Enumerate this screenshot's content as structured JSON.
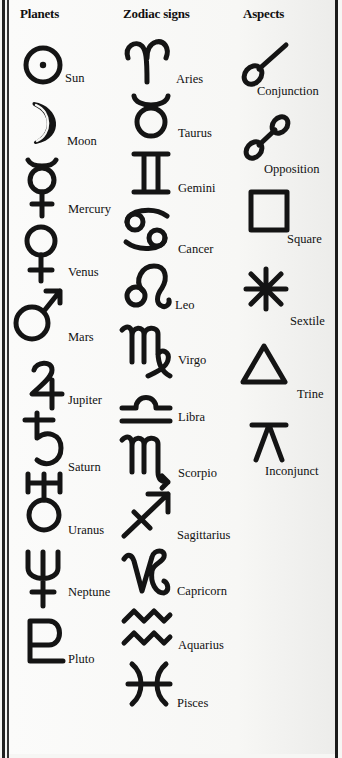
{
  "headers": {
    "planets": "Planets",
    "zodiac": "Zodiac signs",
    "aspects": "Aspects"
  },
  "planets": [
    {
      "name": "Sun",
      "icon": "sun-icon",
      "glyph": "☉"
    },
    {
      "name": "Moon",
      "icon": "moon-icon",
      "glyph": "☽"
    },
    {
      "name": "Mercury",
      "icon": "mercury-icon",
      "glyph": "☿"
    },
    {
      "name": "Venus",
      "icon": "venus-icon",
      "glyph": "♀"
    },
    {
      "name": "Mars",
      "icon": "mars-icon",
      "glyph": "♂"
    },
    {
      "name": "Jupiter",
      "icon": "jupiter-icon",
      "glyph": "♃"
    },
    {
      "name": "Saturn",
      "icon": "saturn-icon",
      "glyph": "♄"
    },
    {
      "name": "Uranus",
      "icon": "uranus-icon",
      "glyph": "♅"
    },
    {
      "name": "Neptune",
      "icon": "neptune-icon",
      "glyph": "♆"
    },
    {
      "name": "Pluto",
      "icon": "pluto-icon",
      "glyph": "♇"
    }
  ],
  "zodiac": [
    {
      "name": "Aries",
      "icon": "aries-icon",
      "glyph": "♈"
    },
    {
      "name": "Taurus",
      "icon": "taurus-icon",
      "glyph": "♉"
    },
    {
      "name": "Gemini",
      "icon": "gemini-icon",
      "glyph": "♊"
    },
    {
      "name": "Cancer",
      "icon": "cancer-icon",
      "glyph": "♋"
    },
    {
      "name": "Leo",
      "icon": "leo-icon",
      "glyph": "♌"
    },
    {
      "name": "Virgo",
      "icon": "virgo-icon",
      "glyph": "♍"
    },
    {
      "name": "Libra",
      "icon": "libra-icon",
      "glyph": "♎"
    },
    {
      "name": "Scorpio",
      "icon": "scorpio-icon",
      "glyph": "♏"
    },
    {
      "name": "Sagittarius",
      "icon": "sagittarius-icon",
      "glyph": "♐"
    },
    {
      "name": "Capricorn",
      "icon": "capricorn-icon",
      "glyph": "♑"
    },
    {
      "name": "Aquarius",
      "icon": "aquarius-icon",
      "glyph": "♒"
    },
    {
      "name": "Pisces",
      "icon": "pisces-icon",
      "glyph": "♓"
    }
  ],
  "aspects": [
    {
      "name": "Conjunction",
      "icon": "conjunction-icon",
      "glyph": "☌"
    },
    {
      "name": "Opposition",
      "icon": "opposition-icon",
      "glyph": "☍"
    },
    {
      "name": "Square",
      "icon": "square-icon",
      "glyph": "□"
    },
    {
      "name": "Sextile",
      "icon": "sextile-icon",
      "glyph": "⚹"
    },
    {
      "name": "Trine",
      "icon": "trine-icon",
      "glyph": "△"
    },
    {
      "name": "Inconjunct",
      "icon": "inconjunct-icon",
      "glyph": "⚻"
    }
  ],
  "colors": {
    "ink": "#141414",
    "paper": "#f7f7f5",
    "border": "#222222"
  }
}
